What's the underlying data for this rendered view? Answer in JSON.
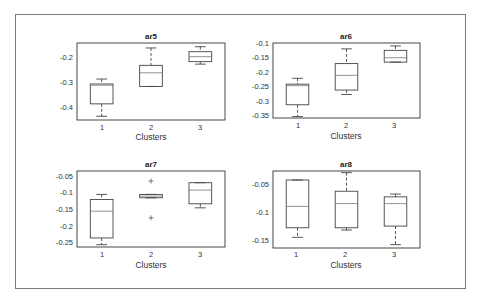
{
  "chart_data": [
    {
      "type": "box",
      "title": "ar5",
      "xlabel": "Clusters",
      "ylabel": "",
      "categories": [
        "1",
        "2",
        "3"
      ],
      "yticks": [
        -0.2,
        -0.3,
        -0.4
      ],
      "ytick_labels": [
        "-0.2",
        "-0.3",
        "-0.4"
      ],
      "ylim": [
        -0.455,
        -0.145
      ],
      "boxes": [
        {
          "cluster": "1",
          "min": -0.44,
          "q1": -0.39,
          "median": -0.315,
          "q3": -0.31,
          "max": -0.29,
          "outliers": []
        },
        {
          "cluster": "2",
          "min": -0.32,
          "q1": -0.32,
          "median": -0.265,
          "q3": -0.235,
          "max": -0.165,
          "outliers": []
        },
        {
          "cluster": "3",
          "min": -0.23,
          "q1": -0.22,
          "median": -0.2,
          "q3": -0.18,
          "max": -0.16,
          "outliers": []
        }
      ]
    },
    {
      "type": "box",
      "title": "ar6",
      "xlabel": "Clusters",
      "ylabel": "",
      "categories": [
        "1",
        "2",
        "3"
      ],
      "yticks": [
        -0.1,
        -0.15,
        -0.2,
        -0.25,
        -0.3,
        -0.35
      ],
      "ytick_labels": [
        "-0.1",
        "-0.15",
        "-0.2",
        "-0.25",
        "-0.3",
        "-0.35"
      ],
      "ylim": [
        -0.355,
        -0.1
      ],
      "boxes": [
        {
          "cluster": "1",
          "min": -0.35,
          "q1": -0.31,
          "median": -0.245,
          "q3": -0.24,
          "max": -0.22,
          "outliers": []
        },
        {
          "cluster": "2",
          "min": -0.275,
          "q1": -0.26,
          "median": -0.21,
          "q3": -0.17,
          "max": -0.12,
          "outliers": []
        },
        {
          "cluster": "3",
          "min": -0.165,
          "q1": -0.165,
          "median": -0.15,
          "q3": -0.125,
          "max": -0.11,
          "outliers": []
        }
      ]
    },
    {
      "type": "box",
      "title": "ar7",
      "xlabel": "Clusters",
      "ylabel": "",
      "categories": [
        "1",
        "2",
        "3"
      ],
      "yticks": [
        -0.05,
        -0.1,
        -0.15,
        -0.2,
        -0.25
      ],
      "ytick_labels": [
        "-0.05",
        "-0.1",
        "-0.15",
        "-0.2",
        "-0.25"
      ],
      "ylim": [
        -0.262,
        -0.035
      ],
      "boxes": [
        {
          "cluster": "1",
          "min": -0.255,
          "q1": -0.235,
          "median": -0.155,
          "q3": -0.12,
          "max": -0.105,
          "outliers": []
        },
        {
          "cluster": "2",
          "min": -0.115,
          "q1": -0.115,
          "median": -0.11,
          "q3": -0.105,
          "max": -0.105,
          "outliers": [
            -0.065,
            -0.175
          ]
        },
        {
          "cluster": "3",
          "min": -0.145,
          "q1": -0.133,
          "median": -0.092,
          "q3": -0.07,
          "max": -0.07,
          "outliers": []
        }
      ]
    },
    {
      "type": "box",
      "title": "ar8",
      "xlabel": "Clusters",
      "ylabel": "",
      "categories": [
        "1",
        "2",
        "3"
      ],
      "yticks": [
        -0.05,
        -0.1,
        -0.15
      ],
      "ytick_labels": [
        "-0.05",
        "-0.1",
        "-0.15"
      ],
      "ylim": [
        -0.164,
        -0.027
      ],
      "boxes": [
        {
          "cluster": "1",
          "min": -0.145,
          "q1": -0.128,
          "median": -0.09,
          "q3": -0.043,
          "max": -0.043,
          "outliers": []
        },
        {
          "cluster": "2",
          "min": -0.132,
          "q1": -0.128,
          "median": -0.085,
          "q3": -0.063,
          "max": -0.03,
          "outliers": []
        },
        {
          "cluster": "3",
          "min": -0.158,
          "q1": -0.125,
          "median": -0.085,
          "q3": -0.073,
          "max": -0.068,
          "outliers": []
        }
      ]
    }
  ],
  "panels": {
    "p0": {
      "title": "ar5",
      "xlabel": "Clusters",
      "x1": "1",
      "x2": "2",
      "x3": "3",
      "t0": "-0.2",
      "t1": "-0.3",
      "t2": "-0.4"
    },
    "p1": {
      "title": "ar6",
      "xlabel": "Clusters",
      "x1": "1",
      "x2": "2",
      "x3": "3",
      "t0": "-0.1",
      "t1": "-0.15",
      "t2": "-0.2",
      "t3": "-0.25",
      "t4": "-0.3",
      "t5": "-0.35"
    },
    "p2": {
      "title": "ar7",
      "xlabel": "Clusters",
      "x1": "1",
      "x2": "2",
      "x3": "3",
      "t0": "-0.05",
      "t1": "-0.1",
      "t2": "-0.15",
      "t3": "-0.2",
      "t4": "-0.25"
    },
    "p3": {
      "title": "ar8",
      "xlabel": "Clusters",
      "x1": "1",
      "x2": "2",
      "x3": "3",
      "t0": "-0.05",
      "t1": "-0.1",
      "t2": "-0.15"
    }
  },
  "colors": {
    "axis": "#333333",
    "box": "#444444",
    "median": "#777777",
    "frame": "#7a7a7a"
  }
}
